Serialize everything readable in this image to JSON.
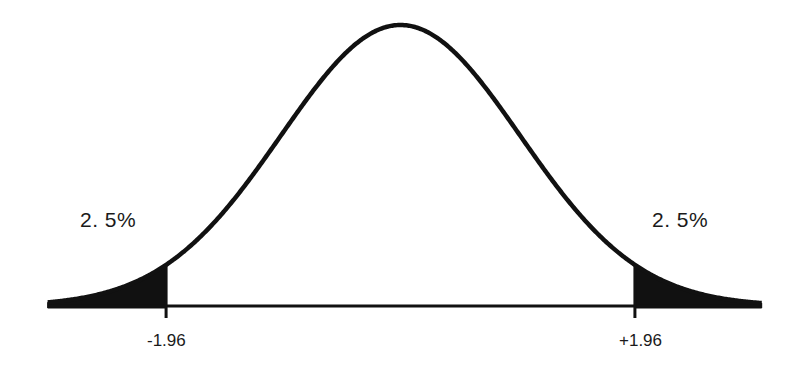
{
  "chart_data": {
    "type": "area",
    "title": "",
    "xlabel": "",
    "ylabel": "",
    "distribution": {
      "name": "normal",
      "mean": 0,
      "sd": 1
    },
    "x_range": [
      -2.95,
      3.02
    ],
    "critical_values": [
      -1.96,
      1.96
    ],
    "tick_labels": [
      "-1.96",
      "+1.96"
    ],
    "shaded_regions": [
      {
        "from": -2.95,
        "to": -1.96,
        "area_label": "2. 5%"
      },
      {
        "from": 1.96,
        "to": 3.02,
        "area_label": "2. 5%"
      }
    ],
    "annotations": [
      {
        "text": "2. 5%",
        "position": "left-tail"
      },
      {
        "text": "2. 5%",
        "position": "right-tail"
      }
    ],
    "grid": false,
    "legend": null
  },
  "labels": {
    "left_area": "2. 5%",
    "right_area": "2. 5%",
    "left_tick": "-1.96",
    "right_tick": "+1.96"
  },
  "colors": {
    "curve": "#111111",
    "fill": "#111111",
    "axis": "#111111",
    "background": "#ffffff"
  },
  "geometry": {
    "center_px": 400.5,
    "sigma_px": 119.6,
    "baseline_y": 306,
    "peak_height_px": 281
  }
}
